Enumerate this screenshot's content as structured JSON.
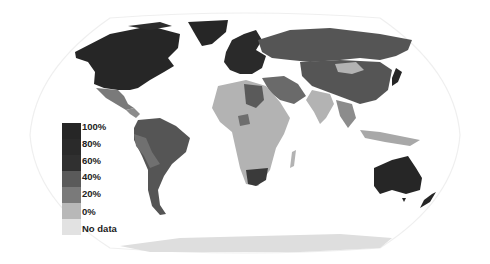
{
  "map": {
    "projection": "robinson-style world map",
    "frame_color": "#eeeeee",
    "colors": {
      "c100": "#262626",
      "c80": "#2e2e2e",
      "c60": "#555555",
      "c40": "#6e6e6e",
      "c20": "#8c8c8c",
      "c0": "#b3b3b3",
      "nodata": "#dedede"
    }
  },
  "legend": {
    "items": [
      {
        "label": "100%",
        "color": "#262626"
      },
      {
        "label": "80%",
        "color": "#2a2a2a"
      },
      {
        "label": "60%",
        "color": "#303030"
      },
      {
        "label": "40%",
        "color": "#5a5a5a"
      },
      {
        "label": "20%",
        "color": "#7a7a7a"
      },
      {
        "label": "0%",
        "color": "#b8b8b8"
      },
      {
        "label": "No data",
        "color": "#e2e2e2"
      }
    ]
  }
}
